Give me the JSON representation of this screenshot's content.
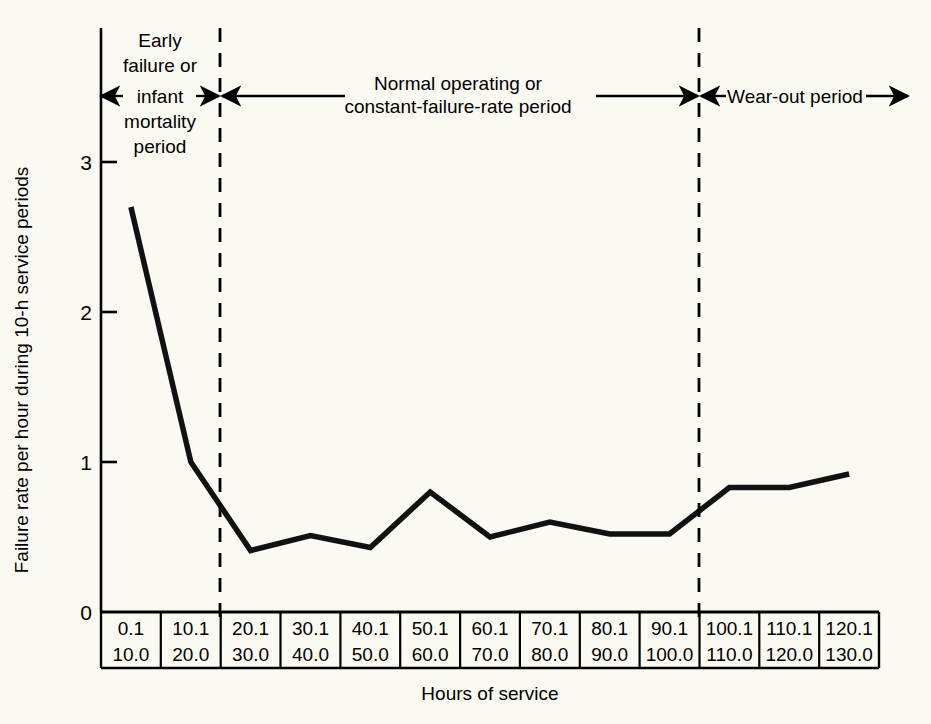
{
  "figure": {
    "background_color": "#fbfaf2",
    "line_color": "#111111",
    "axis_color": "#000000"
  },
  "axes": {
    "y_title": "Failure rate per hour during 10-h service periods",
    "x_title": "Hours of service",
    "y_ticks": [
      "0",
      "1",
      "2",
      "3"
    ],
    "y_min": 0,
    "y_max": 3.6
  },
  "annotations": {
    "region1_lines": [
      "Early",
      "failure or",
      "infant",
      "mortality",
      "period"
    ],
    "region1_arrow_label": "infant",
    "region2_lines": [
      "Normal operating or",
      "constant-failure-rate period"
    ],
    "region3_label": "Wear-out period",
    "divider1_after_bin": 2,
    "divider2_after_bin": 10
  },
  "chart_data": {
    "type": "line",
    "title": "",
    "xlabel": "Hours of service",
    "ylabel": "Failure rate per hour during 10-h service periods",
    "ylim": [
      0,
      3.6
    ],
    "grid": false,
    "legend": "none",
    "categories": [
      "0.1\n10.0",
      "10.1\n20.0",
      "20.1\n30.0",
      "30.1\n40.0",
      "40.1\n50.0",
      "50.1\n60.0",
      "60.1\n70.0",
      "70.1\n80.0",
      "80.1\n90.0",
      "90.1\n100.0",
      "100.1\n110.0",
      "110.1\n120.0",
      "120.1\n130.0"
    ],
    "bin_top": [
      "0.1",
      "10.1",
      "20.1",
      "30.1",
      "40.1",
      "50.1",
      "60.1",
      "70.1",
      "80.1",
      "90.1",
      "100.1",
      "110.1",
      "120.1"
    ],
    "bin_bottom": [
      "10.0",
      "20.0",
      "30.0",
      "40.0",
      "50.0",
      "60.0",
      "70.0",
      "80.0",
      "90.0",
      "100.0",
      "110.0",
      "120.0",
      "130.0"
    ],
    "values": [
      2.7,
      1.0,
      0.41,
      0.51,
      0.43,
      0.8,
      0.5,
      0.6,
      0.52,
      0.52,
      0.83,
      0.83,
      0.92
    ],
    "series": [
      {
        "name": "Failure rate",
        "values": [
          2.7,
          1.0,
          0.41,
          0.51,
          0.43,
          0.8,
          0.5,
          0.6,
          0.52,
          0.52,
          0.83,
          0.83,
          0.92
        ]
      }
    ],
    "regions": [
      {
        "label": "Early failure or infant mortality period",
        "bins": [
          0,
          1
        ]
      },
      {
        "label": "Normal operating or constant-failure-rate period",
        "bins": [
          2,
          9
        ]
      },
      {
        "label": "Wear-out period",
        "bins": [
          10,
          12
        ]
      }
    ]
  }
}
